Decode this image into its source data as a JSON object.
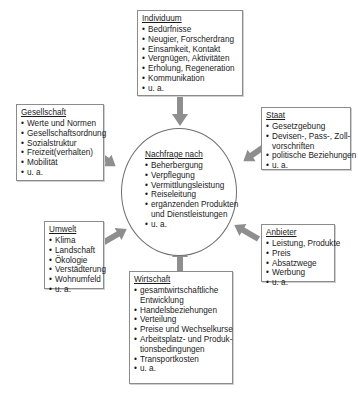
{
  "center": {
    "title": "Nachfrage nach",
    "items": [
      "Beherbergung",
      "Verpflegung",
      "Vermittlungsleistung",
      "Reiseleitung",
      "ergänzenden Produkten",
      "und Dienstleistungen",
      "u. a."
    ]
  },
  "boxes": {
    "individuum": {
      "title": "Individuum",
      "items": [
        "Bedürfnisse",
        "Neugier, Forscherdrang",
        "Einsamkeit, Kontakt",
        "Vergnügen, Aktivitäten",
        "Erholung, Regeneration",
        "Kommunikation",
        "u. a."
      ]
    },
    "gesellschaft": {
      "title": "Gesellschaft",
      "items": [
        "Werte und Normen",
        "Gesellschaftsordnung",
        "Sozialstruktur",
        "Freizeit(verhalten)",
        "Mobilität",
        "u. a."
      ]
    },
    "staat": {
      "title": "Staat",
      "items": [
        "Gesetzgebung",
        "Devisen-, Pass-, Zoll-",
        "vorschriften",
        "politische Beziehungen",
        "u. a."
      ]
    },
    "umwelt": {
      "title": "Umwelt",
      "items": [
        "Klima",
        "Landschaft",
        "Ökologie",
        "Verstädterung",
        "Wohnumfeld",
        "u. a."
      ]
    },
    "anbieter": {
      "title": "Anbieter",
      "items": [
        "Leistung, Produkte",
        "Preis",
        "Absatzwege",
        "Werbung",
        "u. a."
      ]
    },
    "wirtschaft": {
      "title": "Wirtschaft",
      "items": [
        "gesamtwirtschaftliche",
        "Entwicklung",
        "Handelsbeziehungen",
        "Verteilung",
        "Preise und Wechselkurse",
        "Arbeitsplatz- und Produk-",
        "tionsbedingungen",
        "Transportkosten",
        "u. a."
      ]
    }
  },
  "colors": {
    "arrow": "#8e8e8e",
    "border": "#8c8c8c",
    "circle": "#6f6f6f"
  }
}
